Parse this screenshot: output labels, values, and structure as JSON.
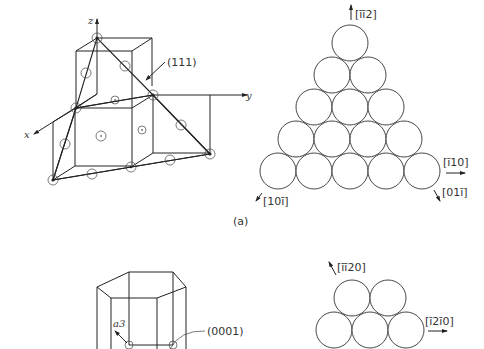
{
  "figure": {
    "part_a_label": "(a)",
    "fcc": {
      "axes": {
        "x": "x",
        "y": "y",
        "z": "z"
      },
      "plane_label": "(111)",
      "directions": {
        "up": "[īī2]",
        "right": "[ī10]",
        "lower_left": "[10ī]",
        "lower_right": "[01ī]"
      },
      "close_packed_rows": [
        1,
        2,
        3,
        4,
        5
      ]
    },
    "hcp": {
      "axis_label": "a3",
      "plane_label": "(0001)",
      "directions": {
        "upper_left": "[īī20]",
        "right": "[ī2ī0]"
      },
      "close_packed_rows": [
        2,
        3
      ]
    }
  }
}
